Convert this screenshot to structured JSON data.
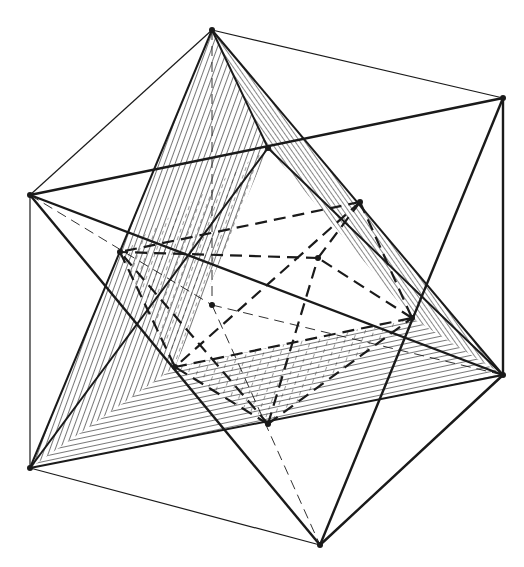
{
  "figure": {
    "title": "",
    "background": "#ffffff",
    "ink": "#1a1a1a",
    "cube_vertices": {
      "A": [
        212,
        30
      ],
      "B": [
        503,
        98
      ],
      "C": [
        30,
        195
      ],
      "D": [
        268,
        148
      ],
      "E": [
        30,
        468
      ],
      "F": [
        320,
        545
      ],
      "G": [
        503,
        375
      ],
      "H": [
        212,
        305
      ]
    },
    "octahedron_vertices": {
      "T": [
        360,
        202
      ],
      "L": [
        120,
        252
      ],
      "R": [
        412,
        318
      ],
      "Bt": [
        268,
        424
      ],
      "Fr": [
        175,
        367
      ],
      "Bk": [
        318,
        258
      ]
    },
    "cube_edges": [
      [
        "A",
        "B"
      ],
      [
        "A",
        "C"
      ],
      [
        "B",
        "G"
      ],
      [
        "C",
        "E"
      ],
      [
        "E",
        "F"
      ],
      [
        "F",
        "G"
      ],
      [
        "A",
        "H"
      ],
      [
        "H",
        "F"
      ]
    ],
    "tetra_1_edges": [
      [
        "C",
        "B"
      ],
      [
        "C",
        "F"
      ],
      [
        "C",
        "G"
      ],
      [
        "B",
        "F"
      ],
      [
        "B",
        "G"
      ],
      [
        "F",
        "G"
      ]
    ],
    "tetra_2_edges": [
      [
        "A",
        "D"
      ],
      [
        "A",
        "E"
      ],
      [
        "A",
        "G"
      ],
      [
        "D",
        "E"
      ],
      [
        "D",
        "G"
      ],
      [
        "E",
        "G"
      ]
    ],
    "octahedron_edges": [
      [
        "T",
        "L"
      ],
      [
        "T",
        "R"
      ],
      [
        "T",
        "Fr"
      ],
      [
        "T",
        "Bk"
      ],
      [
        "Bt",
        "L"
      ],
      [
        "Bt",
        "R"
      ],
      [
        "Bt",
        "Fr"
      ],
      [
        "Bt",
        "Bk"
      ],
      [
        "L",
        "Fr"
      ],
      [
        "Fr",
        "R"
      ],
      [
        "R",
        "Bk"
      ],
      [
        "Bk",
        "L"
      ]
    ],
    "hatched_faces": [
      {
        "name": "face-ADE",
        "points": [
          "A",
          "D",
          "E"
        ],
        "hatch": "vertical"
      },
      {
        "name": "face-AEG",
        "points": [
          "E",
          "G",
          "Fr"
        ],
        "hatch": "horizontal"
      },
      {
        "name": "face-ADG",
        "points": [
          "A",
          "D",
          "G"
        ],
        "hatch": "diagonal"
      }
    ]
  }
}
